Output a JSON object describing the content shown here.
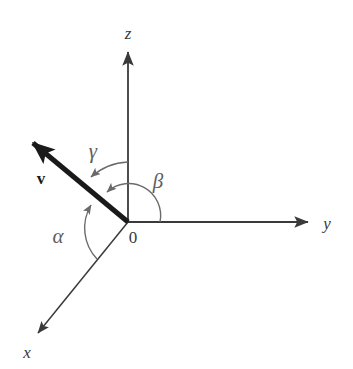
{
  "figure": {
    "background_color": "#ffffff",
    "axis_color": "#3a3a3a",
    "vector_color": "#1a1a1a",
    "arc_color": "#6a6a6a",
    "label_color": "#3a3a3a",
    "angle_label_color": "#5e5e5e"
  },
  "axes": [
    {
      "id": "z",
      "label": "z",
      "label_x": 128,
      "label_y": 39,
      "from": [
        128,
        222
      ],
      "to": [
        128,
        50
      ],
      "arrow": "at-end"
    },
    {
      "id": "y",
      "label": "y",
      "label_x": 327,
      "label_y": 229,
      "from": [
        128,
        222
      ],
      "to": [
        311,
        222
      ],
      "arrow": "at-end"
    },
    {
      "id": "x",
      "label": "x",
      "label_x": 27,
      "label_y": 358,
      "from": [
        128,
        222
      ],
      "to": [
        35,
        337
      ],
      "arrow": "at-end"
    }
  ],
  "origin": {
    "label": "0",
    "x": 128,
    "y": 222,
    "label_x": 133,
    "label_y": 243
  },
  "vector": {
    "label": "v",
    "label_x": 41,
    "label_y": 184,
    "from": [
      128,
      222
    ],
    "to": [
      28,
      139
    ],
    "stroke_width": 5,
    "arrow": "at-end"
  },
  "angles": [
    {
      "id": "alpha",
      "label": "α",
      "label_x": 58,
      "label_y": 243,
      "between": [
        "x-axis",
        "vector"
      ],
      "radius": 45,
      "start_point": [
        97,
        258
      ],
      "end_point": [
        90,
        203
      ],
      "arrow": "at-vector"
    },
    {
      "id": "beta",
      "label": "β",
      "label_x": 158,
      "label_y": 188,
      "between": [
        "y-axis",
        "vector"
      ],
      "radius": 32,
      "start_point": [
        160,
        222
      ],
      "end_point": [
        104,
        193
      ],
      "arrow": "at-vector"
    },
    {
      "id": "gamma",
      "label": "γ",
      "label_x": 93,
      "label_y": 158,
      "between": [
        "z-axis",
        "vector"
      ],
      "radius": 60,
      "start_point": [
        128,
        162
      ],
      "end_point": [
        88,
        179
      ],
      "arrow": "at-vector"
    }
  ]
}
